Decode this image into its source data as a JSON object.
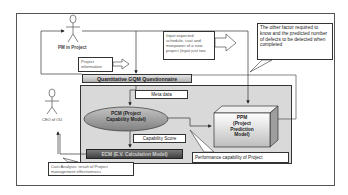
{
  "diagram": {
    "actors": {
      "pm": {
        "label": "PM in Project"
      },
      "ceo": {
        "label": "CEO of OU"
      }
    },
    "questionnaire": {
      "label": "Quantitative GQM Questionnaire"
    },
    "nodes": {
      "pcm": {
        "line1": "PCM (Project",
        "line2": "Capability Model)"
      },
      "ppm": {
        "line1": "PPM",
        "line2": "(Project",
        "line3": "Prediction",
        "line4": "Model)"
      },
      "ecm": {
        "label": "ECM (E.V. Calculation Model)"
      }
    },
    "labels": {
      "project_information": "Project information",
      "input_expected": "Input expected schedule, cost and manpower of a new project (input just two",
      "other_factor": "The other factor required to know and the predicted number of defects to be detected when completed",
      "meta_data": "Meta data",
      "capability_score": "Capability Score",
      "performance_capability": "Performance capability of Project",
      "cost_analysis": "Cost Analysis: result of Project management effectiveness"
    },
    "colors": {
      "panel": "#d9d9d9",
      "ellipse": "#9a9a9a",
      "ecm_bar": "#5a5a5a",
      "questionnaire_bar": "#c8c8c8",
      "line": "#333333"
    }
  }
}
